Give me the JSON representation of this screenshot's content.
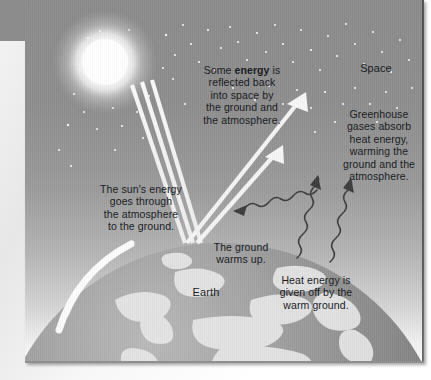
{
  "diagram": {
    "title_semantic": "greenhouse-effect-diagram",
    "palette": {
      "sky_top": "#8a8a8a",
      "sky_bottom": "#fbfbfb",
      "gutter": "#8c8c8c",
      "text": "#14161a",
      "sun": "#ffffff",
      "beam": "#f2f2f2",
      "wave": "#3b3b3b",
      "earth_light": "#e8e8e8",
      "earth_dark": "#6f6f6f"
    },
    "labels": {
      "space": "Space",
      "earth": "Earth",
      "reflected_pre": "Some ",
      "reflected_bold": "energy",
      "reflected_post": " is\nreflected back\ninto space by\nthe ground and\nthe atmosphere.",
      "greenhouse": "Greenhouse\ngases absorb\nheat energy,\nwarming the\nground and the\natmosphere.",
      "sun_energy": "The sun's energy\ngoes through\nthe atmosphere\nto the ground.",
      "ground_warms": "The ground\nwarms up.",
      "heat_given_off": "Heat energy is\ngiven off by the\nwarm ground."
    },
    "elements": {
      "sun": "sun-icon",
      "stars": "star-field",
      "incoming_beams": "incoming-sunlight-beams",
      "reflected_arrows": "reflected-energy-arrows",
      "heat_waves": "heat-energy-wavy-arrows",
      "earth": "earth-sphere"
    }
  }
}
